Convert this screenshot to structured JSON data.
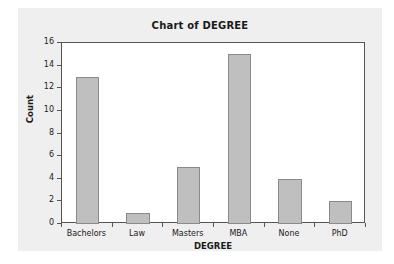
{
  "chart_data": {
    "type": "bar",
    "title": "Chart of DEGREE",
    "xlabel": "DEGREE",
    "ylabel": "Count",
    "categories": [
      "Bachelors",
      "Law",
      "Masters",
      "MBA",
      "None",
      "PhD"
    ],
    "values": [
      13,
      1,
      5,
      15,
      4,
      2
    ],
    "ylim": [
      0,
      16
    ],
    "ytick_labels": [
      "0",
      "2",
      "4",
      "6",
      "8",
      "10",
      "12",
      "14",
      "16"
    ],
    "ytick_values": [
      0,
      2,
      4,
      6,
      8,
      10,
      12,
      14,
      16
    ],
    "grid": false,
    "legend": false,
    "legend_position": "none",
    "colors": {
      "bar_fill": "#bfbfbf",
      "bar_border": "#8a8a8a",
      "plot_background": "#ffffff",
      "card_background": "#efefef",
      "axis": "#555555",
      "text": "#1a1a1a"
    }
  }
}
